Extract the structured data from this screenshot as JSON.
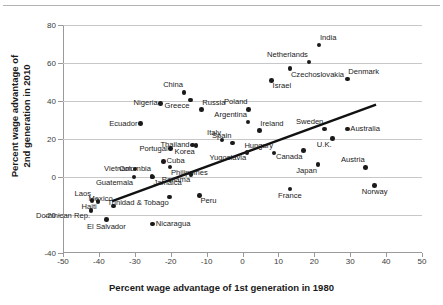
{
  "chart_data": {
    "type": "scatter",
    "title": "",
    "xlabel": "Percent wage advantage of 1st generation in 1980",
    "ylabel": "Percent wage advantage of 2nd generation in 2010",
    "xlim": [
      -50,
      50
    ],
    "ylim": [
      -40,
      80
    ],
    "xticks": [
      -50,
      -40,
      -30,
      -20,
      -10,
      0,
      10,
      20,
      30,
      40,
      50
    ],
    "yticks": [
      -40,
      -20,
      0,
      20,
      40,
      60,
      80
    ],
    "xtick_labels": [
      "-50",
      "-40",
      "-30",
      "-20",
      "-10",
      "0",
      "10",
      "20",
      "30",
      "40",
      "50"
    ],
    "ytick_labels": [
      "-40",
      "-20",
      "0",
      "20",
      "40",
      "60",
      "80"
    ],
    "grid": "horizontal",
    "legend": "none",
    "trendline": {
      "type": "linear-fit",
      "x_start": -36.3,
      "y_start": -12.7,
      "x_end": 37.2,
      "y_end": 38.1
    },
    "points": [
      {
        "label": "India",
        "x": 21.3,
        "y": 69.5,
        "lpos": "tr"
      },
      {
        "label": "Netherlands",
        "x": 18.5,
        "y": 60.5,
        "lpos": "tl"
      },
      {
        "label": "Czechoslovakia",
        "x": 13.2,
        "y": 57.0,
        "lpos": "br"
      },
      {
        "label": "Denmark",
        "x": 29.2,
        "y": 51.5,
        "lpos": "tr"
      },
      {
        "label": "Israel",
        "x": 8.1,
        "y": 50.8,
        "lpos": "br"
      },
      {
        "label": "China",
        "x": -16.3,
        "y": 44.5,
        "lpos": "tl"
      },
      {
        "label": "Greece",
        "x": -14.5,
        "y": 40.6,
        "lpos": "bl"
      },
      {
        "label": "Nigeria",
        "x": -22.8,
        "y": 38.7,
        "lpos": "l"
      },
      {
        "label": "Russia",
        "x": -11.5,
        "y": 35.5,
        "lpos": "tr"
      },
      {
        "label": "Poland",
        "x": 1.7,
        "y": 35.6,
        "lpos": "tl"
      },
      {
        "label": "Argentina",
        "x": 1.5,
        "y": 29.0,
        "lpos": "tl"
      },
      {
        "label": "Ecuador",
        "x": -28.4,
        "y": 28.1,
        "lpos": "l"
      },
      {
        "label": "Ireland",
        "x": 4.7,
        "y": 24.4,
        "lpos": "tr"
      },
      {
        "label": "Sweden",
        "x": 22.8,
        "y": 25.2,
        "lpos": "tl"
      },
      {
        "label": "Australia",
        "x": 29.2,
        "y": 25.2,
        "lpos": "r"
      },
      {
        "label": "U.K.",
        "x": 25.1,
        "y": 20.2,
        "lpos": "bl"
      },
      {
        "label": "Italy",
        "x": -5.7,
        "y": 19.4,
        "lpos": "tl"
      },
      {
        "label": "Spain",
        "x": -2.8,
        "y": 17.8,
        "lpos": "tl"
      },
      {
        "label": "Thailand",
        "x": -13.9,
        "y": 16.8,
        "lpos": "l"
      },
      {
        "label": "Korea",
        "x": -13.0,
        "y": 16.5,
        "lpos": "bl"
      },
      {
        "label": "Portugal",
        "x": -20.0,
        "y": 14.9,
        "lpos": "l"
      },
      {
        "label": "Hungary",
        "x": 8.8,
        "y": 12.7,
        "lpos": "tl"
      },
      {
        "label": "Canada",
        "x": 17.0,
        "y": 13.9,
        "lpos": "bl"
      },
      {
        "label": "Yugoslavia",
        "x": 1.3,
        "y": 13.0,
        "lpos": "bl"
      },
      {
        "label": "Cuba",
        "x": -22.0,
        "y": 8.2,
        "lpos": "r"
      },
      {
        "label": "Japan",
        "x": 21.0,
        "y": 6.5,
        "lpos": "bl"
      },
      {
        "label": "Austria",
        "x": 34.3,
        "y": 5.1,
        "lpos": "tl"
      },
      {
        "label": "Philippines",
        "x": -20.2,
        "y": 5.2,
        "lpos": "br"
      },
      {
        "label": "Vietnam",
        "x": -30.0,
        "y": 4.2,
        "lpos": "l"
      },
      {
        "label": "Colombia",
        "x": -25.2,
        "y": 0.3,
        "lpos": "tl"
      },
      {
        "label": "Panama",
        "x": -14.3,
        "y": 1.4,
        "lpos": "bl"
      },
      {
        "label": "Guatemala",
        "x": -30.2,
        "y": 0.0,
        "lpos": "bl"
      },
      {
        "label": "Jamaica",
        "x": -25.1,
        "y": 0.0,
        "lpos": "br"
      },
      {
        "label": "France",
        "x": 13.2,
        "y": -6.3,
        "lpos": "b"
      },
      {
        "label": "Norway",
        "x": 36.8,
        "y": -4.4,
        "lpos": "b"
      },
      {
        "label": "Peru",
        "x": -12.0,
        "y": -9.7,
        "lpos": "br"
      },
      {
        "label": "Trinidad & Tobago",
        "x": -20.3,
        "y": -10.5,
        "lpos": "bl"
      },
      {
        "label": "Laos",
        "x": -41.9,
        "y": -12.5,
        "lpos": "tl"
      },
      {
        "label": "Mexico",
        "x": -35.9,
        "y": -15.3,
        "lpos": "tl"
      },
      {
        "label": "Haiti",
        "x": -40.3,
        "y": -12.8,
        "lpos": "bl"
      },
      {
        "label": "Dominican Rep.",
        "x": -42.2,
        "y": -17.5,
        "lpos": "bl"
      },
      {
        "label": "El Salvador",
        "x": -37.9,
        "y": -22.5,
        "lpos": "b"
      },
      {
        "label": "Nicaragua",
        "x": -25.0,
        "y": -24.8,
        "lpos": "r"
      }
    ]
  },
  "figure": {
    "x_axis_title": "Percent wage advantage of 1st generation in 1980",
    "y_axis_title_line1": "Percent wage advantage of",
    "y_axis_title_line2": "2nd generation in 2010"
  }
}
